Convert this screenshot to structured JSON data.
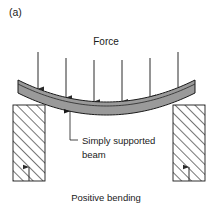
{
  "figure": {
    "panel_label": "(a)",
    "force_label": "Force",
    "callout_line1": "Simply supported",
    "callout_line2": "beam",
    "caption": "Positive bending",
    "colors": {
      "background": "#ffffff",
      "beam_fill": "#9a9a9a",
      "beam_outline": "#1a1a1a",
      "beam_inner_line": "#333333",
      "support_fill": "#ffffff",
      "support_hatch": "#2b2b2b",
      "support_outline": "#1a1a1a",
      "arrow_color": "#2b2b2b",
      "text_color": "#1a1a1a"
    },
    "force_arrows": [
      {
        "x": 38,
        "y_top": 52,
        "y_tip": 87
      },
      {
        "x": 66,
        "y_top": 58,
        "y_tip": 95
      },
      {
        "x": 94,
        "y_top": 60,
        "y_tip": 100
      },
      {
        "x": 122,
        "y_top": 60,
        "y_tip": 100
      },
      {
        "x": 150,
        "y_top": 58,
        "y_tip": 95
      },
      {
        "x": 178,
        "y_top": 52,
        "y_tip": 87
      }
    ],
    "supports": [
      {
        "name": "left-support",
        "x": 13,
        "y": 105,
        "width": 32,
        "height": 76
      },
      {
        "name": "right-support",
        "x": 173,
        "y": 105,
        "width": 32,
        "height": 76
      }
    ],
    "reaction_arrows": [
      {
        "x": 29,
        "y_bottom": 181,
        "y_tip": 167
      },
      {
        "x": 189,
        "y_bottom": 181,
        "y_tip": 167
      }
    ],
    "beam": {
      "left_x": 18,
      "right_x": 195,
      "top_edge_y_ends": 80,
      "top_edge_y_mid": 102,
      "thickness": 13,
      "inner_line_offset": 4
    },
    "callout": {
      "arrow_x": 70,
      "arrow_tip_y": 112,
      "corner_y": 140,
      "elbow_x": 78,
      "text_x": 82,
      "text_y1": 144,
      "text_y2": 158
    },
    "force_label_pos": {
      "x": 106,
      "y": 45
    },
    "panel_label_pos": {
      "x": 9,
      "y": 16
    },
    "caption_pos": {
      "x": 106,
      "y": 201
    }
  }
}
